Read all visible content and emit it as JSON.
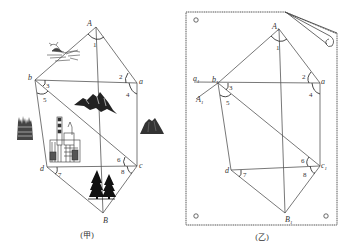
{
  "figure_left": {
    "caption": "(甲)",
    "points": {
      "A": "A",
      "a": "a",
      "b": "b",
      "c": "c",
      "d": "d",
      "B": "B"
    },
    "angles": [
      "1",
      "2",
      "3",
      "4",
      "5",
      "6",
      "7",
      "8"
    ],
    "icons": [
      "bird-icon",
      "mountain-icon",
      "forest-icon",
      "factory-icon",
      "hill-icon",
      "pine-trees-icon"
    ]
  },
  "figure_right": {
    "caption": "(乙)",
    "points": {
      "A1": "A",
      "A1_sub": "1",
      "b1": "b",
      "b1_sub": "1",
      "a": "a",
      "a1": "a",
      "a1_sub": "1",
      "A1_lower": "A",
      "A1_lower_sub": "1",
      "d": "d",
      "c1": "c",
      "c1_sub": "1",
      "B1": "B",
      "B1_sub": "1"
    },
    "angles": [
      "1",
      "2",
      "3",
      "4",
      "5",
      "6",
      "7",
      "8"
    ]
  }
}
